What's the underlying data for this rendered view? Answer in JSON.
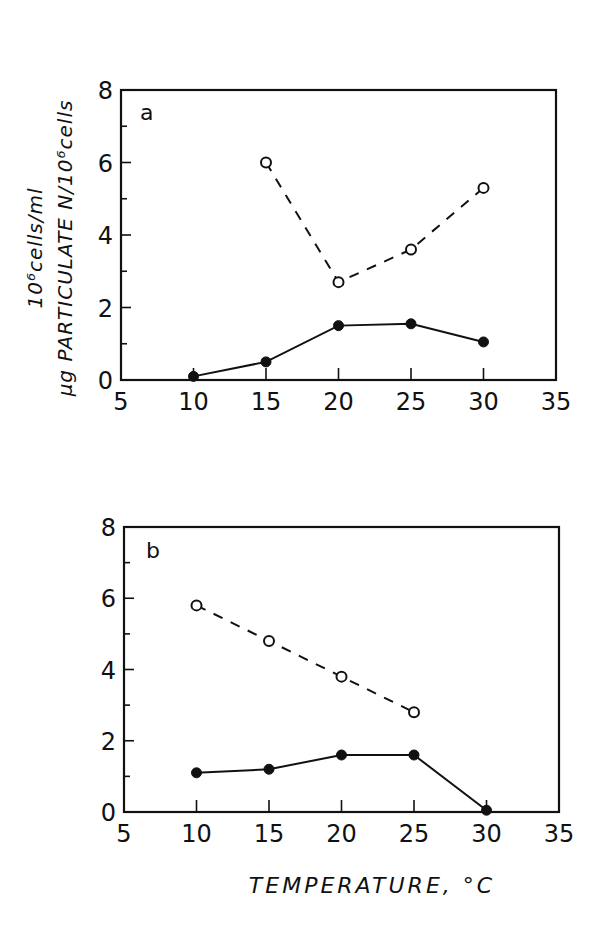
{
  "chart_data": [
    {
      "type": "line",
      "panel": "a",
      "xlabel": "TEMPERATURE, °C",
      "ylabel": [
        "10⁶cells/ml",
        "μg PARTICULATE N/10⁶cells"
      ],
      "xlim": [
        5,
        35
      ],
      "ylim": [
        0,
        8
      ],
      "x_ticks": [
        5,
        10,
        15,
        20,
        25,
        30,
        35
      ],
      "y_ticks": [
        0,
        2,
        4,
        6,
        8
      ],
      "grid": false,
      "legend": null,
      "series": [
        {
          "name": "open circles (dashed)",
          "marker": "open-circle",
          "line": "dashed",
          "x": [
            15,
            20,
            25,
            30
          ],
          "values": [
            6.0,
            2.7,
            3.6,
            5.3
          ]
        },
        {
          "name": "filled circles (solid)",
          "marker": "filled-circle",
          "line": "solid",
          "x": [
            10,
            15,
            20,
            25,
            30
          ],
          "values": [
            0.1,
            0.5,
            1.5,
            1.55,
            1.05
          ]
        }
      ]
    },
    {
      "type": "line",
      "panel": "b",
      "xlabel": "TEMPERATURE, °C",
      "ylabel": "",
      "xlim": [
        5,
        35
      ],
      "ylim": [
        0,
        8
      ],
      "x_ticks": [
        5,
        10,
        15,
        20,
        25,
        30,
        35
      ],
      "y_ticks": [
        0,
        2,
        4,
        6,
        8
      ],
      "grid": false,
      "legend": null,
      "series": [
        {
          "name": "open circles (dashed)",
          "marker": "open-circle",
          "line": "dashed",
          "x": [
            10,
            15,
            20,
            25
          ],
          "values": [
            5.8,
            4.8,
            3.8,
            2.8
          ]
        },
        {
          "name": "filled circles (solid)",
          "marker": "filled-circle",
          "line": "solid",
          "x": [
            10,
            15,
            20,
            25,
            30
          ],
          "values": [
            1.1,
            1.2,
            1.6,
            1.6,
            0.05
          ]
        }
      ]
    }
  ],
  "labels": {
    "panel_a": "a",
    "panel_b": "b",
    "ylabel_line1": "10⁶cells/ml",
    "ylabel_line2": "μg PARTICULATE N/10⁶cells",
    "xlabel": "TEMPERATURE, °C"
  }
}
